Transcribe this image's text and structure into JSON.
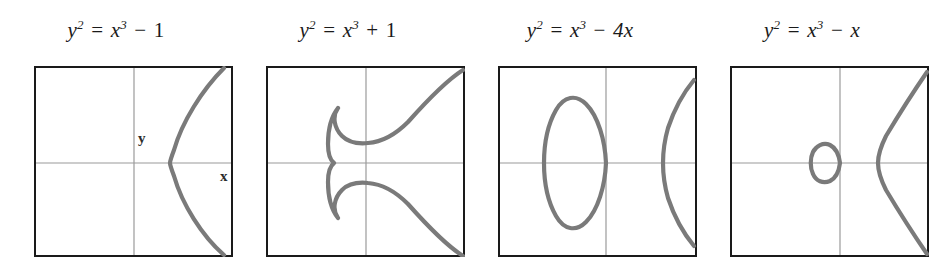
{
  "figure": {
    "background_color": "#ffffff",
    "panel_count": 4
  },
  "style": {
    "curve_color": "#7a7a7a",
    "frame_color": "#1a1a1a",
    "axis_color": "#9a9a9a",
    "title_color": "#1a1a1a",
    "curve_width": 4.2,
    "frame_width": 2,
    "axis_width": 1.2
  },
  "panels": [
    {
      "id": "panel-1",
      "title": {
        "lhs_var": "y",
        "lhs_exp": "2",
        "eq": "=",
        "rhs_var": "x",
        "rhs_exp": "3",
        "op": "−",
        "term": "1",
        "full": "y² = x³ − 1"
      },
      "axis_labels": {
        "x": "x",
        "y": "y"
      },
      "show_axis_labels": true,
      "curve": {
        "equation": "y^2 = x^3 - 1",
        "shape": "single-branch",
        "has_oval": false,
        "vertex_x": 1.0,
        "real_roots": [
          1.0
        ]
      }
    },
    {
      "id": "panel-2",
      "title": {
        "lhs_var": "y",
        "lhs_exp": "2",
        "eq": "=",
        "rhs_var": "x",
        "rhs_exp": "3",
        "op": "+",
        "term": "1",
        "full": "y² = x³ + 1"
      },
      "axis_labels": {
        "x": "x",
        "y": "y"
      },
      "show_axis_labels": false,
      "curve": {
        "equation": "y^2 = x^3 + 1",
        "shape": "single-branch",
        "has_oval": false,
        "vertex_x": -1.0,
        "real_roots": [
          -1.0
        ]
      }
    },
    {
      "id": "panel-3",
      "title": {
        "lhs_var": "y",
        "lhs_exp": "2",
        "eq": "=",
        "rhs_var": "x",
        "rhs_exp": "3",
        "op": "−",
        "term": "4x",
        "full": "y² = x³ − 4x"
      },
      "axis_labels": {
        "x": "x",
        "y": "y"
      },
      "show_axis_labels": false,
      "curve": {
        "equation": "y^2 = x^3 - 4x",
        "shape": "oval-plus-branch",
        "has_oval": true,
        "oval_left": -2.0,
        "oval_right": 0.0,
        "branch_vertex_x": 2.0,
        "real_roots": [
          -2.0,
          0.0,
          2.0
        ]
      }
    },
    {
      "id": "panel-4",
      "title": {
        "lhs_var": "y",
        "lhs_exp": "2",
        "eq": "=",
        "rhs_var": "x",
        "rhs_exp": "3",
        "op": "−",
        "term": "x",
        "full": "y² = x³ − x"
      },
      "axis_labels": {
        "x": "x",
        "y": "y"
      },
      "show_axis_labels": false,
      "curve": {
        "equation": "y^2 = x^3 - x",
        "shape": "oval-plus-branch",
        "has_oval": true,
        "oval_left": -1.0,
        "oval_right": 0.0,
        "branch_vertex_x": 1.0,
        "real_roots": [
          -1.0,
          0.0,
          1.0
        ]
      }
    }
  ]
}
